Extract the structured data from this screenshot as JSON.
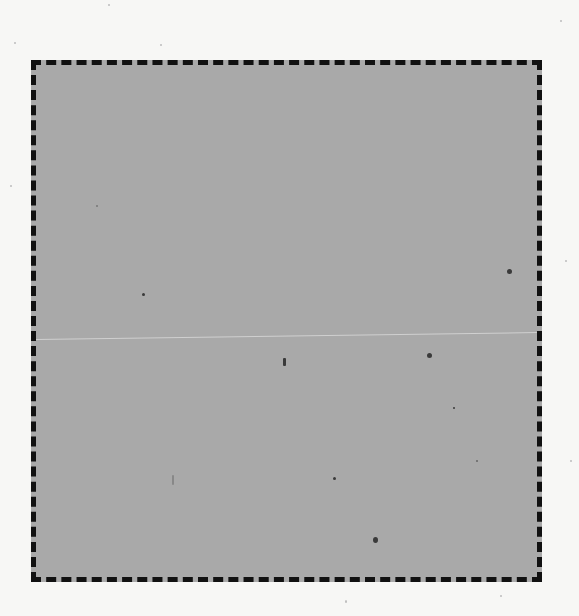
{
  "page": {
    "background_color": "#f7f7f5"
  },
  "box": {
    "fill_color": "#a9a9a9",
    "border_color": "#111111",
    "border_style": "dashed"
  }
}
